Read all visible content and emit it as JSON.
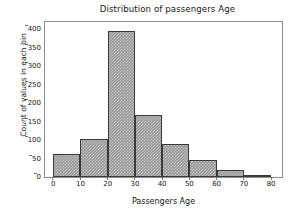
{
  "figure": {
    "background_color": "#ffffff",
    "frame_color": "#8f8f8f"
  },
  "chart_data": {
    "type": "bar",
    "title": "Distribution of passengers Age",
    "xlabel": "Passengers Age",
    "ylabel": "Count of values in each bin",
    "categories": [
      "0-10",
      "10-20",
      "20-30",
      "30-40",
      "40-50",
      "50-60",
      "60-70",
      "70-80"
    ],
    "bin_edges": [
      0,
      10,
      20,
      30,
      40,
      50,
      60,
      70,
      80
    ],
    "values": [
      62,
      102,
      397,
      167,
      90,
      47,
      20,
      6
    ],
    "xlim": [
      -3,
      84
    ],
    "ylim": [
      0,
      420
    ],
    "xticks": [
      0,
      10,
      20,
      30,
      40,
      50,
      60,
      70,
      80
    ],
    "yticks": [
      0,
      50,
      100,
      150,
      200,
      250,
      300,
      350,
      400
    ],
    "xtick_labels": [
      "0",
      "10",
      "20",
      "30",
      "40",
      "50",
      "60",
      "70",
      "80"
    ],
    "ytick_labels": [
      "0",
      "50",
      "100",
      "150",
      "200",
      "250",
      "300",
      "350",
      "400"
    ],
    "grid": false,
    "legend": null,
    "bar_fill_color": "#9d9d9d",
    "bar_edge_color": "#3a3a3a"
  }
}
